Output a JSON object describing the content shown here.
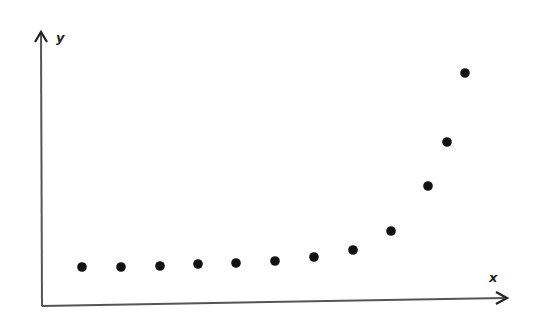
{
  "chart_data": {
    "type": "scatter",
    "title": "",
    "xlabel": "x",
    "ylabel": "y",
    "grid": false,
    "legend": null,
    "x_ticks": [],
    "y_ticks": [],
    "x": [
      1,
      2,
      3,
      4,
      5,
      6,
      7,
      8,
      9,
      10,
      10.5,
      11
    ],
    "values": [
      38,
      38,
      39,
      41,
      42,
      44,
      48,
      55,
      74,
      119,
      163,
      232
    ],
    "pixel_points": [
      [
        82,
        267
      ],
      [
        121,
        267
      ],
      [
        160,
        266
      ],
      [
        198,
        264
      ],
      [
        236,
        263
      ],
      [
        275,
        261
      ],
      [
        314,
        257
      ],
      [
        353,
        250
      ],
      [
        391,
        231
      ],
      [
        428,
        186
      ],
      [
        447,
        142
      ],
      [
        465,
        73
      ]
    ]
  },
  "colors": {
    "axis": "#555555",
    "point": "#111111",
    "label": "#222222",
    "background": "#ffffff"
  },
  "axes": {
    "x_label": "x",
    "y_label": "y"
  }
}
